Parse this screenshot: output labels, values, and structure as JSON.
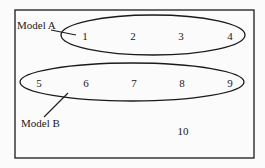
{
  "diagram": {
    "frame": {
      "x": 15,
      "y": 10,
      "width": 239,
      "height": 148
    },
    "stroke_color": "#1a1a1a",
    "background_color": "#fbfbfb",
    "groups": [
      {
        "label": "Model A",
        "ellipse": {
          "cx": 153,
          "cy": 35,
          "rx": 92,
          "ry": 20
        },
        "label_pos": {
          "x": 17,
          "y": 29
        },
        "leader": {
          "x1": 51,
          "y1": 30,
          "x2": 76,
          "y2": 35
        },
        "members": [
          "1",
          "2",
          "3",
          "4"
        ]
      },
      {
        "label": "Model B",
        "ellipse": {
          "cx": 132,
          "cy": 82,
          "rx": 112,
          "ry": 19
        },
        "label_pos": {
          "x": 21,
          "y": 127
        },
        "leader": {
          "x1": 44,
          "y1": 117,
          "x2": 68,
          "y2": 93
        },
        "members": [
          "5",
          "6",
          "7",
          "8",
          "9"
        ]
      }
    ],
    "items": [
      {
        "id": "1",
        "label": "1",
        "x": 85,
        "y": 40
      },
      {
        "id": "2",
        "label": "2",
        "x": 133,
        "y": 40
      },
      {
        "id": "3",
        "label": "3",
        "x": 181,
        "y": 40
      },
      {
        "id": "4",
        "label": "4",
        "x": 230,
        "y": 40
      },
      {
        "id": "5",
        "label": "5",
        "x": 39,
        "y": 87
      },
      {
        "id": "6",
        "label": "6",
        "x": 86,
        "y": 87
      },
      {
        "id": "7",
        "label": "7",
        "x": 134,
        "y": 87
      },
      {
        "id": "8",
        "label": "8",
        "x": 182,
        "y": 87
      },
      {
        "id": "9",
        "label": "9",
        "x": 230,
        "y": 87
      },
      {
        "id": "10",
        "label": "10",
        "x": 183,
        "y": 135
      }
    ]
  }
}
